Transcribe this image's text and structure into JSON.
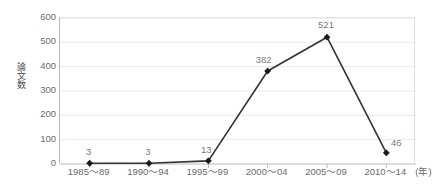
{
  "chart_data": {
    "type": "line",
    "title": "",
    "xlabel": "(年)",
    "ylabel": "論文数",
    "categories": [
      "1985～89",
      "1990～94",
      "1995～99",
      "2000～04",
      "2005～09",
      "2010～14"
    ],
    "values": [
      3,
      3,
      13,
      382,
      521,
      46
    ],
    "point_labels": [
      "3",
      "3",
      "13",
      "382",
      "521",
      "46"
    ],
    "ylim": [
      0,
      600
    ],
    "ytick_labels": [
      "600",
      "500",
      "400",
      "300",
      "200",
      "100",
      "0"
    ],
    "ytick_values": [
      600,
      500,
      400,
      300,
      200,
      100,
      0
    ],
    "grid": true,
    "grid_axis": "y",
    "legend": false,
    "legend_position": "none",
    "series": [
      {
        "name": "論文数",
        "values": [
          3,
          3,
          13,
          382,
          521,
          46
        ],
        "marker": "diamond",
        "line_color": "#333333",
        "marker_color": "#1a1a1a"
      }
    ],
    "colors": {
      "line": "#333333",
      "marker": "#1a1a1a",
      "grid": "#e8e8e8",
      "axis": "#b9b9b9",
      "text": "#6b6b6b",
      "label_text": "#7a7a7a",
      "background": "#ffffff"
    }
  },
  "axis": {
    "x_unit_suffix": "(年)",
    "x_labels": [
      "1985～89",
      "1990～94",
      "1995～99",
      "2000～04",
      "2005～09",
      "2010～14"
    ],
    "y_labels": [
      "600",
      "500",
      "400",
      "300",
      "200",
      "100",
      "0"
    ],
    "y_title": "論文数"
  }
}
